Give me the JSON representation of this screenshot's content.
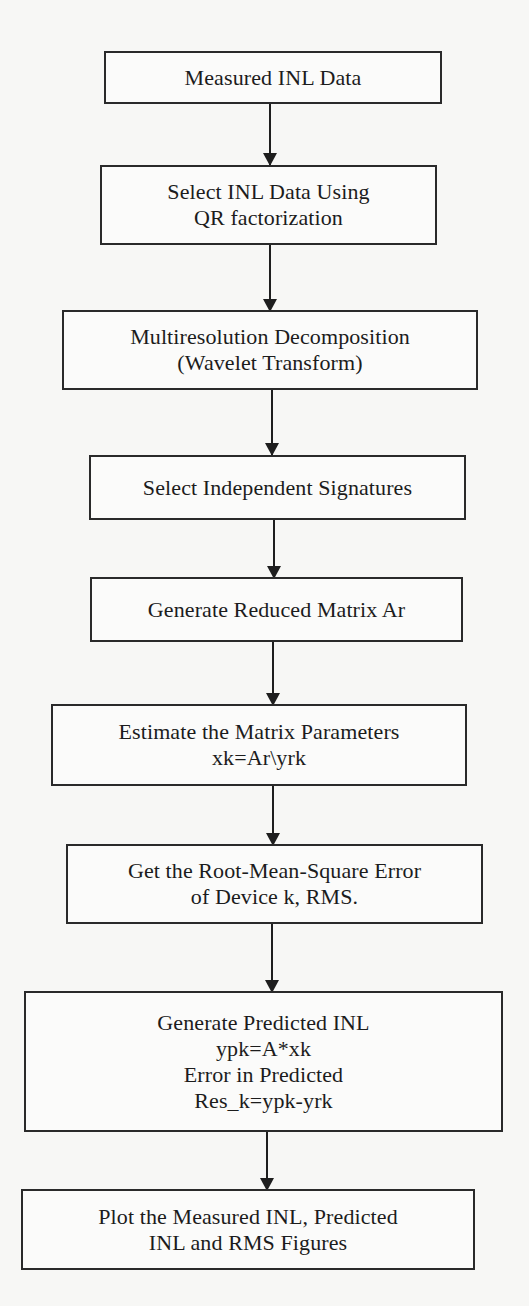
{
  "diagram": {
    "type": "flowchart",
    "direction": "top-to-bottom",
    "colors": {
      "background": "#f7f7f5",
      "box_border": "#2a2a2a",
      "text": "#1c1c1c",
      "arrow": "#1e1e1e"
    },
    "nodes": [
      {
        "id": "n1",
        "lines": [
          "Measured INL Data"
        ]
      },
      {
        "id": "n2",
        "lines": [
          "Select INL Data Using",
          "QR factorization"
        ]
      },
      {
        "id": "n3",
        "lines": [
          "Multiresolution Decomposition",
          "(Wavelet Transform)"
        ]
      },
      {
        "id": "n4",
        "lines": [
          "Select Independent Signatures"
        ]
      },
      {
        "id": "n5",
        "lines": [
          "Generate Reduced Matrix Ar"
        ]
      },
      {
        "id": "n6",
        "lines": [
          "Estimate the Matrix Parameters",
          "xk=Ar\\yrk"
        ]
      },
      {
        "id": "n7",
        "lines": [
          "Get the Root-Mean-Square Error",
          "of Device k, RMS."
        ]
      },
      {
        "id": "n8",
        "lines": [
          "Generate Predicted INL",
          "ypk=A*xk",
          "Error in Predicted",
          "Res_k=ypk-yrk"
        ]
      },
      {
        "id": "n9",
        "lines": [
          "Plot the Measured INL, Predicted",
          "INL and RMS Figures"
        ]
      }
    ],
    "edges": [
      {
        "from": "n1",
        "to": "n2"
      },
      {
        "from": "n2",
        "to": "n3"
      },
      {
        "from": "n3",
        "to": "n4"
      },
      {
        "from": "n4",
        "to": "n5"
      },
      {
        "from": "n5",
        "to": "n6"
      },
      {
        "from": "n6",
        "to": "n7"
      },
      {
        "from": "n7",
        "to": "n8"
      },
      {
        "from": "n8",
        "to": "n9"
      }
    ]
  }
}
